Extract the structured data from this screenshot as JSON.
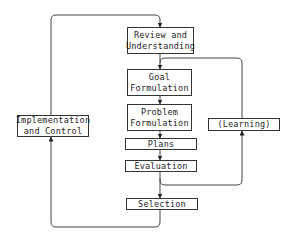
{
  "diagram": {
    "nodes": {
      "review": "Review and\nUnderstanding",
      "goal": "Goal\nFormulation",
      "problem": "Problem\nFormulation",
      "plans": "Plans",
      "evaluation": "Evaluation",
      "selection": "Selection",
      "implementation": "Implementation\nand Control",
      "learning": "(Learning)"
    },
    "edges": [
      {
        "from": "review",
        "to": "goal"
      },
      {
        "from": "goal",
        "to": "problem"
      },
      {
        "from": "problem",
        "to": "plans"
      },
      {
        "from": "plans",
        "to": "evaluation"
      },
      {
        "from": "evaluation",
        "to": "selection"
      },
      {
        "from": "evaluation",
        "to": "learning"
      },
      {
        "from": "learning",
        "to": "goal"
      },
      {
        "from": "selection",
        "to": "implementation"
      },
      {
        "from": "implementation",
        "to": "review"
      }
    ],
    "colors": {
      "line": "#444444",
      "box_border": "#333333",
      "background": "#ffffff"
    }
  }
}
